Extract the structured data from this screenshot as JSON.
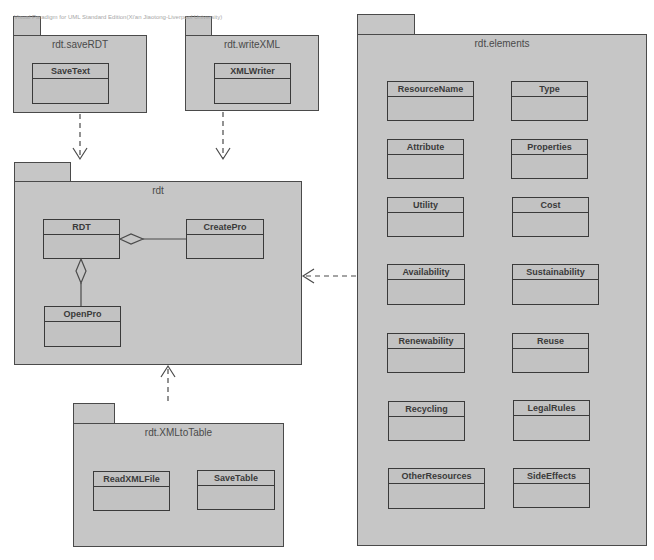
{
  "watermark": "Visual Paradigm for UML Standard Edition(Xi'an Jiaotong-Liverpool University)",
  "colors": {
    "package_fill": "#c6c6c6",
    "stroke": "#4a4a4a",
    "background": "#ffffff"
  },
  "packages": {
    "saveRDT": {
      "name": "rdt.saveRDT",
      "classes": [
        "SaveText"
      ]
    },
    "writeXML": {
      "name": "rdt.writeXML",
      "classes": [
        "XMLWriter"
      ]
    },
    "rdt": {
      "name": "rdt",
      "classes": [
        "RDT",
        "CreatePro",
        "OpenPro"
      ]
    },
    "xmlToTable": {
      "name": "rdt.XMLtoTable",
      "classes": [
        "ReadXMLFile",
        "SaveTable"
      ]
    },
    "elements": {
      "name": "rdt.elements",
      "classes": [
        "ResourceName",
        "Type",
        "Attribute",
        "Properties",
        "Utility",
        "Cost",
        "Availability",
        "Sustainability",
        "Renewability",
        "Reuse",
        "Recycling",
        "LegalRules",
        "OtherResources",
        "SideEffects"
      ]
    }
  },
  "relations": [
    {
      "type": "dependency",
      "from": "rdt.saveRDT",
      "to": "rdt"
    },
    {
      "type": "dependency",
      "from": "rdt.writeXML",
      "to": "rdt"
    },
    {
      "type": "dependency",
      "from": "rdt.elements",
      "to": "rdt"
    },
    {
      "type": "dependency",
      "from": "rdt.XMLtoTable",
      "to": "rdt"
    },
    {
      "type": "aggregation",
      "whole": "RDT",
      "part": "CreatePro"
    },
    {
      "type": "aggregation",
      "whole": "RDT",
      "part": "OpenPro"
    }
  ]
}
